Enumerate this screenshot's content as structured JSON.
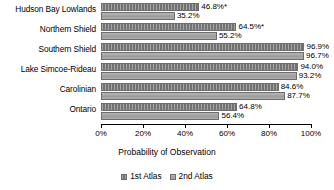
{
  "chart_data": {
    "type": "bar",
    "orientation": "horizontal",
    "title": "",
    "xlabel": "Probability of Observation",
    "ylabel": "",
    "xlim": [
      0,
      100
    ],
    "xticks": [
      "0%",
      "20%",
      "40%",
      "60%",
      "80%",
      "100%"
    ],
    "xtick_values": [
      0,
      20,
      40,
      60,
      80,
      100
    ],
    "grid": false,
    "legend_position": "bottom",
    "categories": [
      "Hudson Bay Lowlands",
      "Northern Shield",
      "Southern Shield",
      "Lake Simcoe-Rideau",
      "Carolinian",
      "Ontario"
    ],
    "series": [
      {
        "name": "1st Atlas",
        "color": "#7f7f7f",
        "values": [
          46.8,
          64.5,
          96.9,
          94.0,
          84.6,
          64.8
        ],
        "labels": [
          "46.8%*",
          "64.5%*",
          "96.9%",
          "94.0%",
          "84.6%",
          "64.8%"
        ]
      },
      {
        "name": "2nd Atlas",
        "color": "#a6a6a6",
        "values": [
          35.2,
          55.2,
          96.7,
          93.2,
          87.7,
          56.4
        ],
        "labels": [
          "35.2%",
          "55.2%",
          "96.7%",
          "93.2%",
          "87.7%",
          "56.4%"
        ]
      }
    ],
    "annotations": {
      "asterisk_note": "*"
    }
  },
  "legend": {
    "items": [
      {
        "label": "1st Atlas"
      },
      {
        "label": "2nd Atlas"
      }
    ]
  }
}
